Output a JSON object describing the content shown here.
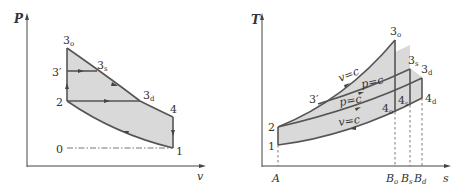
{
  "left_diagram": {
    "title": "P-v diagram",
    "y_axis_label": "P",
    "x_axis_label": "v",
    "points": {
      "p3o": {
        "main": "3",
        "sub": "o"
      },
      "p3prime": {
        "main": "3′"
      },
      "p3s": {
        "main": "3",
        "sub": "s"
      },
      "p3d": {
        "main": "3",
        "sub": "d"
      },
      "p2": {
        "main": "2"
      },
      "p4": {
        "main": "4"
      },
      "p1": {
        "main": "1"
      },
      "p0": {
        "main": "0"
      }
    }
  },
  "right_diagram": {
    "title": "T-s diagram",
    "y_axis_label": "T",
    "x_axis_label": "s",
    "points": {
      "p3o": {
        "main": "3",
        "sub": "o"
      },
      "p3s": {
        "main": "3",
        "sub": "s"
      },
      "p3d": {
        "main": "3",
        "sub": "d"
      },
      "p3prime": {
        "main": "3′"
      },
      "p2": {
        "main": "2"
      },
      "p1": {
        "main": "1"
      },
      "p4o": {
        "main": "4",
        "sub": "o"
      },
      "p4s": {
        "main": "4",
        "sub": "s"
      },
      "p4d": {
        "main": "4",
        "sub": "d"
      }
    },
    "process_labels": {
      "upper_v_const": "v=c",
      "upper_p_const": "p=c",
      "lower_p_const": "p=c",
      "lower_v_const": "v=c"
    },
    "x_ticks": {
      "A": {
        "main": "A"
      },
      "Bo": {
        "main": "B",
        "sub": "o"
      },
      "Bs": {
        "main": "B",
        "sub": "s"
      },
      "Bd": {
        "main": "B",
        "sub": "d"
      }
    }
  },
  "colors": {
    "fill": "#d9d9d9",
    "line": "#555555",
    "text": "#333333"
  }
}
